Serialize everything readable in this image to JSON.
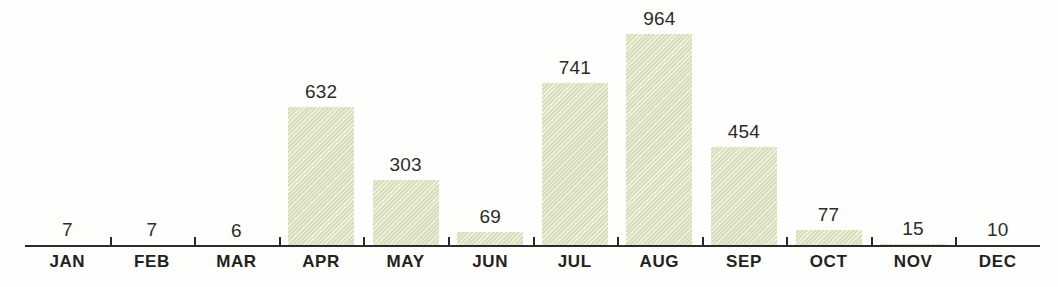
{
  "chart_data": {
    "type": "bar",
    "title": "",
    "xlabel": "",
    "ylabel": "",
    "categories": [
      "JAN",
      "FEB",
      "MAR",
      "APR",
      "MAY",
      "JUN",
      "JUL",
      "AUG",
      "SEP",
      "OCT",
      "NOV",
      "DEC"
    ],
    "values": [
      7,
      7,
      6,
      632,
      303,
      69,
      741,
      964,
      454,
      77,
      15,
      10
    ],
    "value_labels": [
      "7",
      "7",
      "6",
      "632",
      "303",
      "69",
      "741",
      "964",
      "454",
      "77",
      "15",
      "10"
    ],
    "ylim": [
      0,
      964
    ],
    "grid": false,
    "legend": null,
    "axis": {
      "baseline_visible": true,
      "ticks_visible": true,
      "tick_count": 11
    },
    "style": {
      "bar_color": "#dfe5c4",
      "bar_texture": "diagonal-hatch",
      "label_color": "#2c2c2c",
      "axis_color": "#2b2b2b",
      "background": "#fefefc"
    }
  }
}
